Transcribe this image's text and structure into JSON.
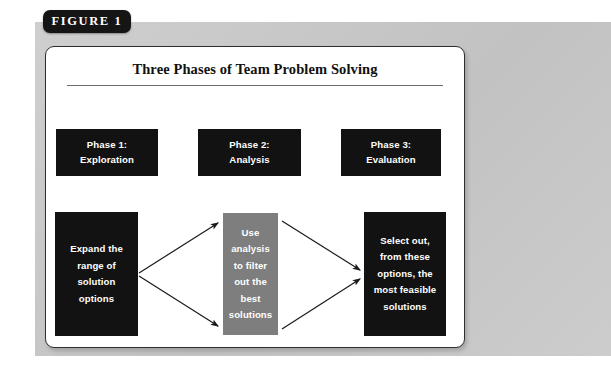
{
  "figure": {
    "label": "FIGURE 1",
    "title": "Three Phases of Team Problem Solving"
  },
  "colors": {
    "panel_gray": "#c9c9c9",
    "card_white": "#ffffff",
    "box_black": "#121212",
    "box_gray": "#7e7e7e",
    "text_white": "#ffffff",
    "rule_gray": "#6d6d6d",
    "border_dark": "#2e2e2e"
  },
  "phases": [
    {
      "name": "phase-1",
      "line1": "Phase 1:",
      "line2": "Exploration"
    },
    {
      "name": "phase-2",
      "line1": "Phase 2:",
      "line2": "Analysis"
    },
    {
      "name": "phase-3",
      "line1": "Phase 3:",
      "line2": "Evaluation"
    }
  ],
  "flow": {
    "expand": {
      "name": "expand-options",
      "fill": "black",
      "lines": [
        "Expand the",
        "range of",
        "solution",
        "options"
      ]
    },
    "filter": {
      "name": "filter-options",
      "fill": "gray",
      "lines": [
        "Use",
        "analysis",
        "to filter",
        "out the",
        "best",
        "solutions"
      ]
    },
    "select": {
      "name": "select-options",
      "fill": "black",
      "lines": [
        "Select out,",
        "from these",
        "options, the",
        "most feasible",
        "solutions"
      ]
    }
  },
  "arrows": [
    {
      "name": "arrow-expand-to-filter-upper",
      "from": "expand",
      "to": "filter",
      "direction": "up-right"
    },
    {
      "name": "arrow-expand-to-filter-lower",
      "from": "expand",
      "to": "filter",
      "direction": "down-right"
    },
    {
      "name": "arrow-filter-to-select-upper",
      "from": "filter",
      "to": "select",
      "direction": "down-right"
    },
    {
      "name": "arrow-filter-to-select-lower",
      "from": "filter",
      "to": "select",
      "direction": "up-right"
    }
  ]
}
